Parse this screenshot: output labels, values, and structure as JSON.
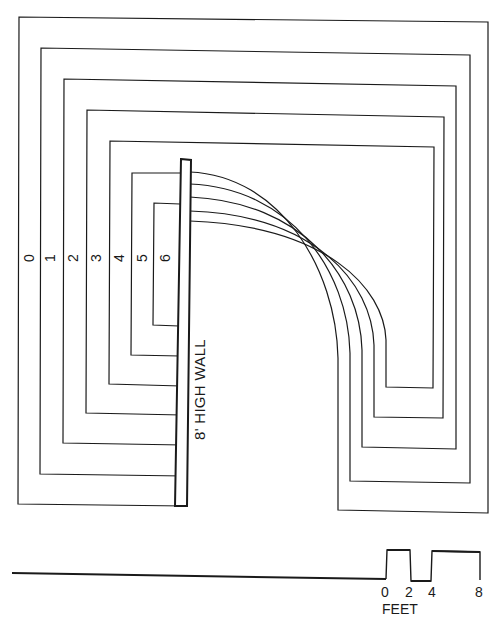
{
  "diagram": {
    "wall_label": "8' HIGH WALL",
    "contour_labels": [
      "0",
      "1",
      "2",
      "3",
      "4",
      "5",
      "6"
    ],
    "scale": {
      "ticks": [
        "0",
        "2",
        "4",
        "8"
      ],
      "unit": "FEET"
    }
  }
}
